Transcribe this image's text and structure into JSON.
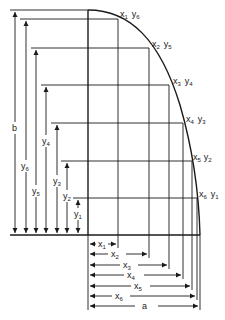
{
  "diagram": {
    "title": "",
    "colors": {
      "ink": "#1a1a1a",
      "background": "#ffffff"
    },
    "curve_points": [
      {
        "x_label": "x",
        "x_sub": "1",
        "y_label": "y",
        "y_sub": "6"
      },
      {
        "x_label": "x",
        "x_sub": "2",
        "y_label": "y",
        "y_sub": "5"
      },
      {
        "x_label": "x",
        "x_sub": "3",
        "y_label": "y",
        "y_sub": "4"
      },
      {
        "x_label": "x",
        "x_sub": "4",
        "y_label": "y",
        "y_sub": "3"
      },
      {
        "x_label": "x",
        "x_sub": "5",
        "y_label": "y",
        "y_sub": "2"
      },
      {
        "x_label": "x",
        "x_sub": "6",
        "y_label": "y",
        "y_sub": "1"
      }
    ],
    "vertical_dimensions": [
      {
        "label": "b",
        "sub": ""
      },
      {
        "label": "y",
        "sub": "6"
      },
      {
        "label": "y",
        "sub": "5"
      },
      {
        "label": "y",
        "sub": "4"
      },
      {
        "label": "y",
        "sub": "3"
      },
      {
        "label": "y",
        "sub": "2"
      },
      {
        "label": "y",
        "sub": "1"
      }
    ],
    "horizontal_dimensions": [
      {
        "label": "x",
        "sub": "1"
      },
      {
        "label": "x",
        "sub": "2"
      },
      {
        "label": "x",
        "sub": "3"
      },
      {
        "label": "x",
        "sub": "4"
      },
      {
        "label": "x",
        "sub": "5"
      },
      {
        "label": "x",
        "sub": "6"
      },
      {
        "label": "a",
        "sub": ""
      }
    ]
  }
}
